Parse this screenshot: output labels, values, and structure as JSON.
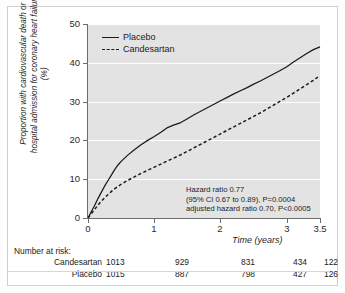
{
  "figure": {
    "background": "#ffffff",
    "plot_background": "#e3e3e3"
  },
  "legend": {
    "position": "top-left-inside",
    "items": [
      {
        "label": "Placebo",
        "style": "solid",
        "color": "#1a1a1a"
      },
      {
        "label": "Candesartan",
        "style": "dashed",
        "color": "#1a1a1a"
      }
    ]
  },
  "annotation": {
    "line1": "Hazard ratio 0.77",
    "line2": "(95% CI 0.67 to 0.89), P=0.0004",
    "line3": "adjusted hazard ratio 0.70, P<0.0005"
  },
  "risk_table": {
    "title": "Number at risk:",
    "rows": [
      {
        "name": "Candesartan",
        "values": [
          "1013",
          "929",
          "831",
          "434",
          "122"
        ]
      },
      {
        "name": "Placebo",
        "values": [
          "1015",
          "887",
          "798",
          "427",
          "126"
        ]
      }
    ]
  },
  "axes": {
    "y_ticks": [
      "0",
      "10",
      "20",
      "30",
      "40",
      "50"
    ],
    "x_ticks": [
      "0",
      "1",
      "2",
      "3",
      "3.5"
    ]
  },
  "chart_data": {
    "type": "line",
    "title": "",
    "subtitle": "",
    "xlabel": "Time (years)",
    "ylabel": "Proportion with cardiovascular death or hospital admission for coronary heart failure (%)",
    "xlim": [
      0,
      3.5
    ],
    "ylim": [
      0,
      50
    ],
    "xticks": [
      0,
      1,
      2,
      3,
      3.5
    ],
    "yticks": [
      0,
      10,
      20,
      30,
      40,
      50
    ],
    "grid": "horizontal-white",
    "legend_position": "upper left (inside plot)",
    "annotations": [
      "Hazard ratio 0.77",
      "(95% CI 0.67 to 0.89), P=0.0004",
      "adjusted hazard ratio 0.70, P<0.0005"
    ],
    "series": [
      {
        "name": "Placebo",
        "style": "solid",
        "color": "#1a1a1a",
        "x": [
          0,
          0.05,
          0.1,
          0.15,
          0.2,
          0.25,
          0.3,
          0.35,
          0.4,
          0.45,
          0.5,
          0.6,
          0.7,
          0.8,
          0.9,
          1.0,
          1.1,
          1.2,
          1.3,
          1.4,
          1.5,
          1.6,
          1.7,
          1.8,
          1.9,
          2.0,
          2.1,
          2.2,
          2.3,
          2.4,
          2.5,
          2.6,
          2.7,
          2.8,
          2.9,
          3.0,
          3.1,
          3.2,
          3.3,
          3.4,
          3.5
        ],
        "y": [
          0,
          1.6,
          3.2,
          5.0,
          6.6,
          8.2,
          9.6,
          11.0,
          12.4,
          13.6,
          14.6,
          16.2,
          17.6,
          18.9,
          20.0,
          21.0,
          22.1,
          23.3,
          24.0,
          24.6,
          25.6,
          26.6,
          27.5,
          28.4,
          29.3,
          30.2,
          31.1,
          32.0,
          32.8,
          33.6,
          34.5,
          35.3,
          36.2,
          37.1,
          38.0,
          39.0,
          40.2,
          41.3,
          42.4,
          43.4,
          44.1
        ]
      },
      {
        "name": "Candesartan",
        "style": "dashed",
        "color": "#1a1a1a",
        "x": [
          0,
          0.05,
          0.1,
          0.15,
          0.2,
          0.25,
          0.3,
          0.35,
          0.4,
          0.45,
          0.5,
          0.6,
          0.7,
          0.8,
          0.9,
          1.0,
          1.1,
          1.2,
          1.3,
          1.4,
          1.5,
          1.6,
          1.7,
          1.8,
          1.9,
          2.0,
          2.1,
          2.2,
          2.3,
          2.4,
          2.5,
          2.6,
          2.7,
          2.8,
          2.9,
          3.0,
          3.1,
          3.2,
          3.3,
          3.4,
          3.5
        ],
        "y": [
          0,
          1.1,
          2.2,
          3.3,
          4.3,
          5.2,
          6.0,
          6.8,
          7.5,
          8.1,
          8.7,
          9.7,
          10.6,
          11.5,
          12.3,
          13.1,
          13.9,
          14.7,
          15.5,
          16.3,
          17.2,
          18.1,
          19.0,
          19.9,
          20.8,
          21.7,
          22.6,
          23.5,
          24.4,
          25.3,
          26.2,
          27.1,
          28.1,
          29.1,
          30.1,
          31.1,
          32.2,
          33.3,
          34.4,
          35.5,
          36.7
        ]
      }
    ],
    "risk_table": {
      "title": "Number at risk:",
      "times": [
        0,
        1,
        2,
        3,
        3.5
      ],
      "rows": [
        {
          "name": "Candesartan",
          "values": [
            1013,
            929,
            831,
            434,
            122
          ]
        },
        {
          "name": "Placebo",
          "values": [
            1015,
            887,
            798,
            427,
            126
          ]
        }
      ]
    }
  }
}
